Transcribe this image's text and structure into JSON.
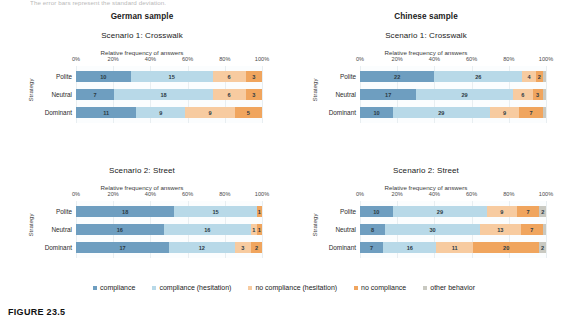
{
  "top_note": "The error bars represent the standard deviation.",
  "caption": "FIGURE 23.5",
  "legend": {
    "items": [
      {
        "label": "compliance",
        "color": "#6e9ec0"
      },
      {
        "label": "compliance (hesitation)",
        "color": "#b8d9e8"
      },
      {
        "label": "no compliance (hesitation)",
        "color": "#f7cba0"
      },
      {
        "label": "no compliance",
        "color": "#f0a55e"
      },
      {
        "label": "other behavior",
        "color": "#c9c9c1"
      }
    ]
  },
  "axis": {
    "xlabel": "Relative frequency of answers",
    "ylabel": "Strategy",
    "ticks": [
      "0%",
      "20%",
      "40%",
      "60%",
      "80%",
      "100%"
    ]
  },
  "panels": {
    "de_s1": {
      "sample": "German sample",
      "scenario": "Scenario 1: Crosswalk"
    },
    "cn_s1": {
      "sample": "Chinese sample",
      "scenario": "Scenario 1: Crosswalk"
    },
    "de_s2": {
      "scenario": "Scenario 2: Street"
    },
    "cn_s2": {
      "scenario": "Scenario 2: Street"
    }
  },
  "chart_data": [
    {
      "id": "de_s1",
      "type": "bar",
      "orientation": "horizontal",
      "stacked": true,
      "normalized": true,
      "title": "German sample — Scenario 1: Crosswalk",
      "xlabel": "Relative frequency of answers",
      "ylabel": "Strategy",
      "xlim": [
        0,
        100
      ],
      "xticks": [
        "0%",
        "20%",
        "40%",
        "60%",
        "80%",
        "100%"
      ],
      "grid": true,
      "legend_position": "bottom",
      "categories": [
        "Polite",
        "Neutral",
        "Dominant"
      ],
      "series": [
        {
          "name": "compliance",
          "values": [
            10,
            7,
            11
          ]
        },
        {
          "name": "compliance (hesitation)",
          "values": [
            15,
            18,
            9
          ]
        },
        {
          "name": "no compliance (hesitation)",
          "values": [
            6,
            6,
            9
          ]
        },
        {
          "name": "no compliance",
          "values": [
            3,
            3,
            5
          ]
        },
        {
          "name": "other behavior",
          "values": [
            0,
            0,
            0
          ]
        }
      ]
    },
    {
      "id": "cn_s1",
      "type": "bar",
      "orientation": "horizontal",
      "stacked": true,
      "normalized": true,
      "title": "Chinese sample — Scenario 1: Crosswalk",
      "xlabel": "Relative frequency of answers",
      "ylabel": "Strategy",
      "xlim": [
        0,
        100
      ],
      "xticks": [
        "0%",
        "20%",
        "40%",
        "60%",
        "80%",
        "100%"
      ],
      "grid": true,
      "legend_position": "bottom",
      "categories": [
        "Polite",
        "Neutral",
        "Dominant"
      ],
      "series": [
        {
          "name": "compliance",
          "values": [
            22,
            17,
            10
          ]
        },
        {
          "name": "compliance (hesitation)",
          "values": [
            26,
            29,
            29
          ]
        },
        {
          "name": "no compliance (hesitation)",
          "values": [
            4,
            6,
            9
          ]
        },
        {
          "name": "no compliance",
          "values": [
            2,
            3,
            7
          ]
        },
        {
          "name": "other behavior",
          "values": [
            1,
            1,
            1
          ]
        }
      ]
    },
    {
      "id": "de_s2",
      "type": "bar",
      "orientation": "horizontal",
      "stacked": true,
      "normalized": true,
      "title": "German sample — Scenario 2: Street",
      "xlabel": "Relative frequency of answers",
      "ylabel": "Strategy",
      "xlim": [
        0,
        100
      ],
      "xticks": [
        "0%",
        "20%",
        "40%",
        "60%",
        "80%",
        "100%"
      ],
      "grid": true,
      "legend_position": "bottom",
      "categories": [
        "Polite",
        "Neutral",
        "Dominant"
      ],
      "series": [
        {
          "name": "compliance",
          "values": [
            18,
            16,
            17
          ]
        },
        {
          "name": "compliance (hesitation)",
          "values": [
            15,
            16,
            12
          ]
        },
        {
          "name": "no compliance (hesitation)",
          "values": [
            0,
            1,
            3
          ]
        },
        {
          "name": "no compliance",
          "values": [
            1,
            1,
            2
          ]
        },
        {
          "name": "other behavior",
          "values": [
            0,
            0,
            0
          ]
        }
      ]
    },
    {
      "id": "cn_s2",
      "type": "bar",
      "orientation": "horizontal",
      "stacked": true,
      "normalized": true,
      "title": "Chinese sample — Scenario 2: Street",
      "xlabel": "Relative frequency of answers",
      "ylabel": "Strategy",
      "xlim": [
        0,
        100
      ],
      "xticks": [
        "0%",
        "20%",
        "40%",
        "60%",
        "80%",
        "100%"
      ],
      "grid": true,
      "legend_position": "bottom",
      "categories": [
        "Polite",
        "Neutral",
        "Dominant"
      ],
      "series": [
        {
          "name": "compliance",
          "values": [
            10,
            8,
            7
          ]
        },
        {
          "name": "compliance (hesitation)",
          "values": [
            29,
            30,
            16
          ]
        },
        {
          "name": "no compliance (hesitation)",
          "values": [
            9,
            13,
            11
          ]
        },
        {
          "name": "no compliance",
          "values": [
            7,
            7,
            20
          ]
        },
        {
          "name": "other behavior",
          "values": [
            2,
            1,
            2
          ]
        }
      ]
    }
  ]
}
